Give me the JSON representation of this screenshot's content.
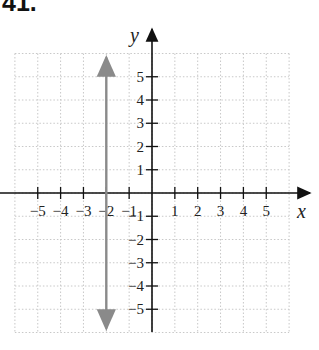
{
  "problem_number": "41.",
  "chart_data": {
    "type": "line",
    "title": "",
    "xlabel": "x",
    "ylabel": "y",
    "xlim": [
      -6,
      6
    ],
    "ylim": [
      -6,
      6
    ],
    "grid": true,
    "x_ticks": [
      -5,
      -4,
      -3,
      -2,
      -1,
      1,
      2,
      3,
      4,
      5
    ],
    "x_tick_labels": [
      "−5",
      "−4",
      "−3",
      "−2",
      "−1",
      "1",
      "2",
      "3",
      "4",
      "5"
    ],
    "y_ticks": [
      -5,
      -4,
      -3,
      -2,
      -1,
      1,
      2,
      3,
      4,
      5
    ],
    "y_tick_labels": [
      "−5",
      "−4",
      "−3",
      "−2",
      "−1",
      "1",
      "2",
      "3",
      "4",
      "5"
    ],
    "series": [
      {
        "name": "x = -2",
        "equation": "x = -2",
        "x": [
          -2,
          -2
        ],
        "y": [
          -6,
          6
        ],
        "color": "#8a8a8a",
        "arrows": "both"
      }
    ]
  }
}
